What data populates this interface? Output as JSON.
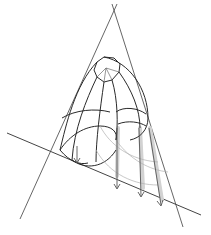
{
  "figure": {
    "colors": {
      "background": "#ffffff",
      "lines": "#2a2a2a",
      "construction": "#555555",
      "shadow": "#d2d2d2"
    },
    "elements": {
      "vanishing_lines": 2,
      "ground_line": 1,
      "projection_arrows": 4
    }
  }
}
